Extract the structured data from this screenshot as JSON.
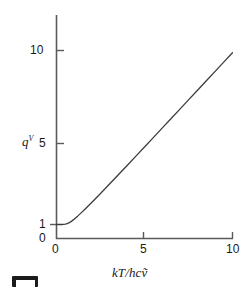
{
  "figure": {
    "background_color": "#ffffff",
    "line_color": "#3c3c3c",
    "axis_color": "#5a5a5a",
    "text_color": "#1a1a1a"
  },
  "axes": {
    "y_label_main": "q",
    "y_label_sup": "V",
    "x_label": "kT/hcṽ",
    "x_ticks": [
      "0",
      "5",
      "10"
    ],
    "y_ticks": [
      "0",
      "1",
      "5",
      "10"
    ]
  },
  "marks": {
    "corner_mark_name": "crop-mark"
  },
  "chart_data": {
    "type": "line",
    "title": "",
    "xlabel": "kT/hcṽ",
    "ylabel": "q^V",
    "xlim": [
      0,
      10
    ],
    "ylim": [
      0,
      11.5
    ],
    "xticks": [
      0,
      5,
      10
    ],
    "yticks": [
      0,
      1,
      5,
      10
    ],
    "grid": false,
    "legend": null,
    "series": [
      {
        "name": "vibrational partition function",
        "x": [
          0.0,
          0.1,
          0.2,
          0.3,
          0.4,
          0.5,
          0.6,
          0.7,
          0.8,
          0.9,
          1.0,
          1.2,
          1.4,
          1.6,
          1.8,
          2.0,
          2.5,
          3.0,
          3.5,
          4.0,
          4.5,
          5.0,
          5.5,
          6.0,
          6.5,
          7.0,
          7.5,
          8.0,
          8.5,
          9.0,
          9.5,
          10.0
        ],
        "y": [
          1.0,
          1.0,
          1.0,
          1.001,
          1.004,
          1.016,
          1.042,
          1.082,
          1.136,
          1.2,
          1.272,
          1.432,
          1.602,
          1.778,
          1.958,
          2.141,
          2.607,
          3.081,
          3.56,
          4.041,
          4.525,
          5.01,
          5.496,
          5.983,
          6.47,
          6.957,
          7.445,
          7.933,
          8.421,
          8.909,
          9.397,
          9.885
        ],
        "formula": "q = 1 / (1 - e^{-hcṽ/kT})"
      }
    ]
  }
}
